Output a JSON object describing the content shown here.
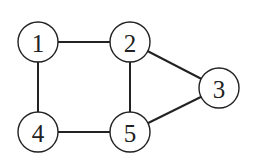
{
  "graph": {
    "nodes": [
      {
        "id": "1",
        "label": "1",
        "x": 38,
        "y": 42
      },
      {
        "id": "2",
        "label": "2",
        "x": 130,
        "y": 42
      },
      {
        "id": "3",
        "label": "3",
        "x": 219,
        "y": 88
      },
      {
        "id": "4",
        "label": "4",
        "x": 38,
        "y": 132
      },
      {
        "id": "5",
        "label": "5",
        "x": 130,
        "y": 132
      }
    ],
    "edges": [
      [
        "1",
        "2"
      ],
      [
        "1",
        "4"
      ],
      [
        "2",
        "5"
      ],
      [
        "2",
        "3"
      ],
      [
        "3",
        "5"
      ],
      [
        "4",
        "5"
      ]
    ],
    "node_radius": 20
  }
}
